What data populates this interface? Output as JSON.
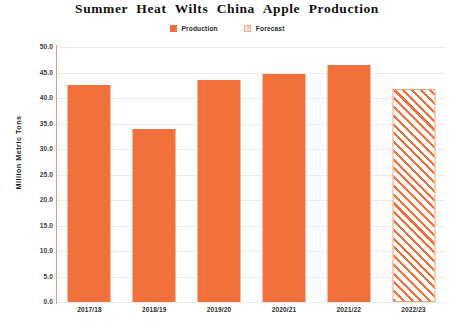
{
  "chart_data": {
    "type": "bar",
    "title": "Summer Heat Wilts China Apple Production",
    "xlabel": "",
    "ylabel": "Million Metric Tons",
    "categories": [
      "2017/18",
      "2018/19",
      "2019/20",
      "2020/21",
      "2021/22",
      "2022/23"
    ],
    "series": [
      {
        "name": "Production",
        "values": [
          42.5,
          34.0,
          43.5,
          44.8,
          46.5,
          null
        ]
      },
      {
        "name": "Forecast",
        "values": [
          null,
          null,
          null,
          null,
          null,
          41.8
        ]
      }
    ],
    "values": [
      42.5,
      34.0,
      43.5,
      44.8,
      46.5,
      41.8
    ],
    "bar_styles": [
      "solid",
      "solid",
      "solid",
      "solid",
      "solid",
      "hatched"
    ],
    "ylim": [
      0.0,
      50.0
    ],
    "ytick_step": 5.0,
    "yticks": [
      "50.0",
      "45.0",
      "40.0",
      "35.0",
      "30.0",
      "25.0",
      "20.0",
      "15.0",
      "10.0",
      "5.0",
      "0.0"
    ],
    "ytick_values": [
      50.0,
      45.0,
      40.0,
      35.0,
      30.0,
      25.0,
      20.0,
      15.0,
      10.0,
      5.0,
      0.0
    ],
    "grid": true,
    "grid_axis": "y",
    "legend_position": "top-center",
    "legend": [
      {
        "label": "Production",
        "swatch": "solid",
        "color": "#F1703C"
      },
      {
        "label": "Forecast",
        "swatch": "hatched",
        "color": "#F1703C"
      }
    ]
  },
  "colors": {
    "bar": "#F1703C",
    "forecast_stripe": "#F1703C",
    "forecast_border": "#F3A277",
    "gridline": "#ECEAEA",
    "axis_spine": "#F1874F",
    "background": "#FFFFFF",
    "text": "#1A1A1A"
  },
  "caption": {
    "bottom_text": ""
  }
}
